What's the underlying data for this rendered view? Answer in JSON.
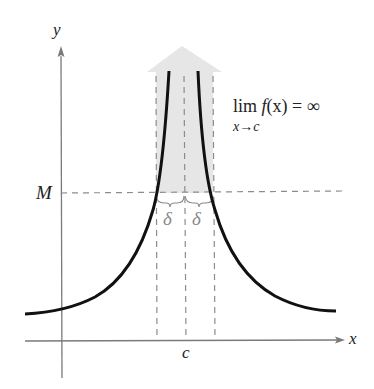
{
  "figure": {
    "labels": {
      "y_axis": "y",
      "x_axis": "x",
      "M": "M",
      "c": "c",
      "delta_left": "δ",
      "delta_right": "δ",
      "limit_expr": "lim f(x) = ∞",
      "limit_lim": "lim",
      "limit_fx": "f",
      "limit_rest": "(x) = ∞",
      "limit_sub": "x→c"
    },
    "colors": {
      "curve": "#111111",
      "axes": "#7a7a7a",
      "dashed": "#8c8c8c",
      "shade": "#e6e6e6",
      "delta": "#8a8a8a",
      "text": "#222222"
    }
  }
}
